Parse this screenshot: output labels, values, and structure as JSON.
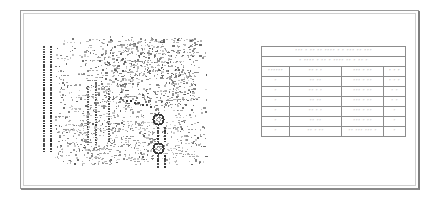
{
  "document": {
    "kind": "scanned-engineering-drawing",
    "sheet_background": "#ffffff",
    "frame_color": "#9a9a9a",
    "ink_color": "#8d8d8d",
    "legibility": "illegible",
    "note": "Low-resolution scan; all lettering renders as unreadable marks."
  },
  "artwork": {
    "label": "pcb-assembly-plot",
    "description": "Dense component/pad plot with two connector pad columns at left, scattered part footprints, and two ringed mounting holes at lower right."
  },
  "table": {
    "title_row": "˝˝˝ ˝ ˝˝ ˝˝ ˝˝˝˝ ˝ ˝ ˝˝˝ ˝˝ ˝˝˝",
    "subtitle_row": "˝ ˝˝˝˝ ˝ ˝˝ ˝ ˝˝˝˝ ˝˝ ˝ ˝˝ ˝",
    "headers": [
      "˝˝˝˝˝˝",
      "˝˝ ˝ ˝",
      "˝˝˝ ˝ ˝˝",
      "˝ ˝ ˝"
    ],
    "rows": [
      [
        "˝",
        "˝˝ ˝˝",
        "˝˝˝ ˝ ˝˝",
        "˝ ˝ ˝"
      ],
      [
        "˝",
        "˝˝ ˝ ˝",
        "˝˝˝ ˝ ˝˝",
        "˝ ˝"
      ],
      [
        "˝",
        "˝˝ ˝˝",
        "˝˝˝ ˝ ˝˝",
        "˝ ˝"
      ],
      [
        "˝",
        "˝˝ ˝ ˝",
        "˝˝˝ ˝ ˝˝",
        "˝"
      ],
      [
        "˝",
        "˝˝ ˝˝",
        "˝˝˝ ˝ ˝˝",
        "˝"
      ],
      [
        "˝",
        "˝˝ ˝ ˝˝",
        "˝˝ ˝˝˝ ˝˝˝ ˝",
        "˝"
      ]
    ]
  }
}
